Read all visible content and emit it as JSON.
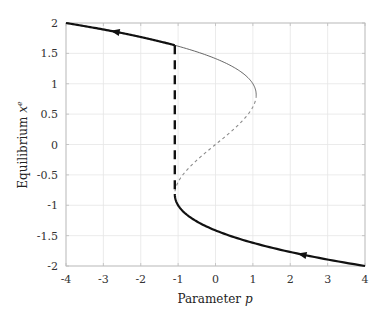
{
  "chart_data": {
    "type": "line",
    "title": "",
    "xlabel": "Parameter p",
    "ylabel": "Equilibrium x^e",
    "xlabel_parts": {
      "text": "Parameter ",
      "var": "p"
    },
    "ylabel_parts": {
      "text": "Equilibrium ",
      "var": "x",
      "sup": "e"
    },
    "xlim": [
      -4,
      4
    ],
    "ylim": [
      -2,
      2
    ],
    "xticks": [
      -4,
      -3,
      -2,
      -1,
      0,
      1,
      2,
      3,
      4
    ],
    "yticks": [
      -2,
      -1.5,
      -1,
      -0.5,
      0,
      0.5,
      1,
      1.5,
      2
    ],
    "xtick_labels": [
      "-4",
      "-3",
      "-2",
      "-1",
      "0",
      "1",
      "2",
      "3",
      "4"
    ],
    "ytick_labels": [
      "-2",
      "-1.5",
      "-1",
      "-0.5",
      "0",
      "0.5",
      "1",
      "1.5",
      "2"
    ],
    "grid": true,
    "legend": null,
    "relation": "p = 2x - x^3",
    "fold_points": [
      {
        "p": 1.089,
        "x": 0.816
      },
      {
        "p": -1.089,
        "x": -0.816
      }
    ],
    "series": [
      {
        "name": "upper stable branch (hysteresis path, thick)",
        "style": "solid-thick",
        "color": "#111111",
        "x_range": [
          -4,
          -1.089
        ],
        "points": [
          [
            -4,
            2
          ],
          [
            -3,
            1.89
          ],
          [
            -2,
            1.77
          ],
          [
            -1.089,
            1.63
          ]
        ],
        "arrow": {
          "at_p": -2.7,
          "direction": "decreasing-p"
        }
      },
      {
        "name": "upper stable branch (thin)",
        "style": "solid-thin",
        "color": "#555555",
        "x_range": [
          -1.089,
          1.089
        ],
        "points": [
          [
            -1.089,
            1.63
          ],
          [
            0,
            1.414
          ],
          [
            0.5,
            1.25
          ],
          [
            1.089,
            0.816
          ]
        ]
      },
      {
        "name": "unstable middle branch",
        "style": "dotted",
        "color": "#888888",
        "points": [
          [
            1.089,
            0.816
          ],
          [
            0.5,
            0.26
          ],
          [
            0,
            0
          ],
          [
            -0.5,
            -0.26
          ],
          [
            -1.089,
            -0.816
          ]
        ]
      },
      {
        "name": "lower stable branch (thick)",
        "style": "solid-thick",
        "color": "#111111",
        "x_range": [
          -1.089,
          4
        ],
        "points": [
          [
            -1.089,
            -0.816
          ],
          [
            0,
            -1.414
          ],
          [
            1,
            -1.62
          ],
          [
            2,
            -1.77
          ],
          [
            3,
            -1.89
          ],
          [
            4,
            -2
          ]
        ],
        "arrow": {
          "at_p": 2.3,
          "direction": "decreasing-p"
        }
      },
      {
        "name": "jump (fold transition)",
        "style": "dashed-thick",
        "color": "#111111",
        "points": [
          [
            -1.089,
            1.63
          ],
          [
            -1.089,
            -0.816
          ]
        ]
      }
    ]
  }
}
